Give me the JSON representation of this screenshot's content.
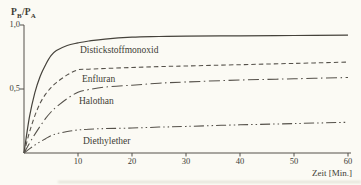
{
  "chart_data": {
    "type": "line",
    "title": "",
    "xlabel": "Zeit [Min.]",
    "ylabel": "PB/PA",
    "ylabel_parts": [
      "P",
      "B",
      "/P",
      "A"
    ],
    "xlim": [
      0,
      60
    ],
    "ylim": [
      0,
      1.0
    ],
    "grid": false,
    "legend_position": "inline-labels",
    "x_tick_labels": [
      "10",
      "20",
      "30",
      "40",
      "50",
      "60"
    ],
    "y_ticks": [
      {
        "value": 1.0,
        "label": "1,0"
      },
      {
        "value": 0.5,
        "label": "0,5"
      }
    ],
    "line_color": "#55514a",
    "series": [
      {
        "name": "Distickstoffmonoxid",
        "style": "solid",
        "points": [
          [
            0,
            0
          ],
          [
            1,
            0.28
          ],
          [
            2,
            0.47
          ],
          [
            3,
            0.6
          ],
          [
            4,
            0.69
          ],
          [
            5,
            0.76
          ],
          [
            6,
            0.8
          ],
          [
            8,
            0.84
          ],
          [
            10,
            0.86
          ],
          [
            12,
            0.875
          ],
          [
            15,
            0.89
          ],
          [
            20,
            0.905
          ],
          [
            25,
            0.91
          ],
          [
            30,
            0.913
          ],
          [
            40,
            0.916
          ],
          [
            50,
            0.918
          ],
          [
            60,
            0.92
          ]
        ]
      },
      {
        "name": "Enfluran",
        "style": "dashed",
        "points": [
          [
            0,
            0
          ],
          [
            1,
            0.16
          ],
          [
            2,
            0.29
          ],
          [
            3,
            0.39
          ],
          [
            4,
            0.46
          ],
          [
            5,
            0.51
          ],
          [
            6,
            0.55
          ],
          [
            8,
            0.61
          ],
          [
            10,
            0.65
          ],
          [
            12,
            0.655
          ],
          [
            15,
            0.66
          ],
          [
            20,
            0.668
          ],
          [
            25,
            0.675
          ],
          [
            30,
            0.68
          ],
          [
            40,
            0.69
          ],
          [
            50,
            0.7
          ],
          [
            60,
            0.71
          ]
        ]
      },
      {
        "name": "Halothan",
        "style": "dash-dot",
        "points": [
          [
            0,
            0
          ],
          [
            1,
            0.075
          ],
          [
            2,
            0.145
          ],
          [
            3,
            0.21
          ],
          [
            4,
            0.27
          ],
          [
            5,
            0.32
          ],
          [
            6,
            0.36
          ],
          [
            8,
            0.425
          ],
          [
            10,
            0.475
          ],
          [
            12,
            0.495
          ],
          [
            15,
            0.515
          ],
          [
            20,
            0.53
          ],
          [
            25,
            0.545
          ],
          [
            30,
            0.555
          ],
          [
            40,
            0.57
          ],
          [
            50,
            0.58
          ],
          [
            60,
            0.59
          ]
        ]
      },
      {
        "name": "Diethylether",
        "style": "dash-dot-dot",
        "points": [
          [
            0,
            0
          ],
          [
            1,
            0.032
          ],
          [
            2,
            0.062
          ],
          [
            3,
            0.088
          ],
          [
            4,
            0.112
          ],
          [
            5,
            0.135
          ],
          [
            6,
            0.15
          ],
          [
            8,
            0.168
          ],
          [
            10,
            0.18
          ],
          [
            12,
            0.186
          ],
          [
            15,
            0.191
          ],
          [
            20,
            0.195
          ],
          [
            25,
            0.202
          ],
          [
            30,
            0.208
          ],
          [
            40,
            0.22
          ],
          [
            50,
            0.23
          ],
          [
            60,
            0.24
          ]
        ]
      }
    ]
  }
}
